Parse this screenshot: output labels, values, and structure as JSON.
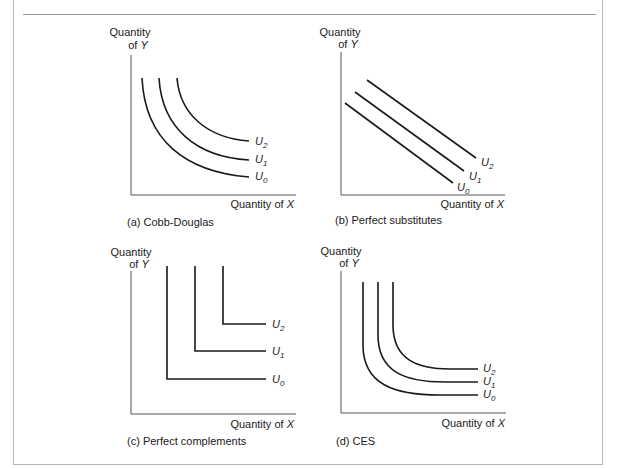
{
  "header": {
    "partial_caption": "Cobb-Douglas ... Perfect substitutes ... Perfect complements ... CES"
  },
  "panels": [
    {
      "id": "a",
      "caption": "(a) Cobb-Douglas",
      "y_label_line1": "Quantity",
      "y_label_line2_prefix": "of ",
      "y_label_var": "Y",
      "x_label_prefix": "Quantity of ",
      "x_label_var": "X",
      "curves": [
        {
          "label": "U",
          "sub": "2"
        },
        {
          "label": "U",
          "sub": "1"
        },
        {
          "label": "U",
          "sub": "0"
        }
      ]
    },
    {
      "id": "b",
      "caption": "(b) Perfect substitutes",
      "y_label_line1": "Quantity",
      "y_label_line2_prefix": "of ",
      "y_label_var": "Y",
      "x_label_prefix": "Quantity of ",
      "x_label_var": "X",
      "curves": [
        {
          "label": "U",
          "sub": "2"
        },
        {
          "label": "U",
          "sub": "1"
        },
        {
          "label": "U",
          "sub": "0"
        }
      ]
    },
    {
      "id": "c",
      "caption": "(c) Perfect complements",
      "y_label_line1": "Quantity",
      "y_label_line2_prefix": "of ",
      "y_label_var": "Y",
      "x_label_prefix": "Quantity of ",
      "x_label_var": "X",
      "curves": [
        {
          "label": "U",
          "sub": "2"
        },
        {
          "label": "U",
          "sub": "1"
        },
        {
          "label": "U",
          "sub": "0"
        }
      ]
    },
    {
      "id": "d",
      "caption": "(d) CES",
      "y_label_line1": "Quantity",
      "y_label_line2_prefix": "of ",
      "y_label_var": "Y",
      "x_label_prefix": "Quantity of ",
      "x_label_var": "X",
      "curves": [
        {
          "label": "U",
          "sub": "2"
        },
        {
          "label": "U",
          "sub": "1"
        },
        {
          "label": "U",
          "sub": "0"
        }
      ]
    }
  ],
  "colors": {
    "ink": "#1a1a1a",
    "axis": "#555555",
    "frame": "#b5b5b5"
  }
}
